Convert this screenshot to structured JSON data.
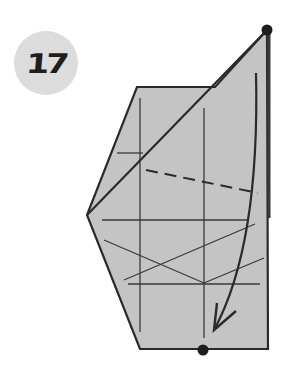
{
  "step": {
    "number": "17"
  },
  "colors": {
    "paper": "#c4c4c4",
    "outline": "#2a2a2a",
    "crease": "#3a3a3a",
    "badge": "#dcdcdc",
    "badge_text": "#1e1e1e"
  },
  "diagram": {
    "paper_outline": "137,87 215,87 267,30 268,349 140,349 87,215",
    "front_flap": "87,215 267,30 268,218",
    "valley_fold_dashed": {
      "x1": 146,
      "y1": 170,
      "x2": 258,
      "y2": 193
    },
    "crease_lines": [
      {
        "x1": 140,
        "y1": 98,
        "x2": 140,
        "y2": 332
      },
      {
        "x1": 204,
        "y1": 108,
        "x2": 204,
        "y2": 338
      },
      {
        "x1": 102,
        "y1": 220,
        "x2": 248,
        "y2": 220
      },
      {
        "x1": 128,
        "y1": 284,
        "x2": 260,
        "y2": 284
      },
      {
        "x1": 104,
        "y1": 240,
        "x2": 204,
        "y2": 283
      },
      {
        "x1": 124,
        "y1": 280,
        "x2": 255,
        "y2": 224
      },
      {
        "x1": 204,
        "y1": 283,
        "x2": 264,
        "y2": 258
      },
      {
        "x1": 117,
        "y1": 153,
        "x2": 143,
        "y2": 153
      }
    ],
    "arrow": {
      "path": "M256,73 C258,160 252,260 214,330",
      "head": "M217,303 L214,330 L236,311"
    },
    "reference_points": [
      {
        "name": "top-point",
        "cx": 267,
        "cy": 30
      },
      {
        "name": "bottom-point",
        "cx": 203,
        "cy": 350
      }
    ]
  }
}
